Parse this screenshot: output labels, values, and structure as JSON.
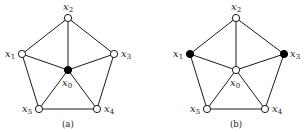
{
  "panels": [
    {
      "caption": "(a)",
      "nodes": [
        {
          "id": "x0",
          "label": "x",
          "sub": "0",
          "x": 68,
          "y": 70,
          "filled": true,
          "lx": 62,
          "ly": 86
        },
        {
          "id": "x1",
          "label": "x",
          "sub": "1",
          "x": 22,
          "y": 54,
          "filled": false,
          "lx": 5,
          "ly": 57
        },
        {
          "id": "x2",
          "label": "x",
          "sub": "2",
          "x": 68,
          "y": 18,
          "filled": false,
          "lx": 63,
          "ly": 10
        },
        {
          "id": "x3",
          "label": "x",
          "sub": "3",
          "x": 114,
          "y": 54,
          "filled": false,
          "lx": 121,
          "ly": 57
        },
        {
          "id": "x4",
          "label": "x",
          "sub": "4",
          "x": 97,
          "y": 109,
          "filled": false,
          "lx": 104,
          "ly": 112
        },
        {
          "id": "x5",
          "label": "x",
          "sub": "5",
          "x": 39,
          "y": 109,
          "filled": false,
          "lx": 22,
          "ly": 112
        }
      ]
    },
    {
      "caption": "(b)",
      "nodes": [
        {
          "id": "x0",
          "label": "x",
          "sub": "0",
          "x": 236,
          "y": 70,
          "filled": false,
          "lx": 230,
          "ly": 86
        },
        {
          "id": "x1",
          "label": "x",
          "sub": "1",
          "x": 190,
          "y": 54,
          "filled": true,
          "lx": 173,
          "ly": 57
        },
        {
          "id": "x2",
          "label": "x",
          "sub": "2",
          "x": 236,
          "y": 18,
          "filled": false,
          "lx": 231,
          "ly": 10
        },
        {
          "id": "x3",
          "label": "x",
          "sub": "3",
          "x": 284,
          "y": 54,
          "filled": true,
          "lx": 290,
          "ly": 57
        },
        {
          "id": "x4",
          "label": "x",
          "sub": "4",
          "x": 265,
          "y": 109,
          "filled": false,
          "lx": 272,
          "ly": 112
        },
        {
          "id": "x5",
          "label": "x",
          "sub": "5",
          "x": 207,
          "y": 109,
          "filled": false,
          "lx": 190,
          "ly": 112
        }
      ]
    }
  ],
  "edges": [
    [
      "x1",
      "x2"
    ],
    [
      "x2",
      "x3"
    ],
    [
      "x3",
      "x4"
    ],
    [
      "x4",
      "x5"
    ],
    [
      "x5",
      "x1"
    ],
    [
      "x0",
      "x1"
    ],
    [
      "x0",
      "x2"
    ],
    [
      "x0",
      "x3"
    ],
    [
      "x0",
      "x4"
    ],
    [
      "x0",
      "x5"
    ]
  ],
  "captions": {
    "a": "(a)",
    "b": "(b)"
  },
  "colors": {
    "stroke": "#1a1a1a",
    "filled": "#000000",
    "open": "#ffffff"
  }
}
